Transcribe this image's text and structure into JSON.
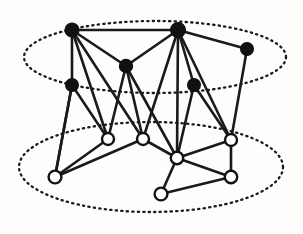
{
  "figure": {
    "background_color": "#fdfdfb",
    "width": 303,
    "height": 234,
    "edge_color": "#1a1a1a",
    "filled_node_color": "#111111",
    "hollow_node_fill": "#ffffff",
    "dotted_ellipse_color": "#1a1a1a"
  },
  "layers": [
    {
      "id": "upper-layer",
      "name": "upper-layer-ellipse",
      "style": "dotted",
      "cx": 155,
      "cy": 57,
      "rx": 131,
      "ry": 36
    },
    {
      "id": "lower-layer",
      "name": "lower-layer-ellipse",
      "style": "dotted",
      "cx": 151,
      "cy": 167,
      "rx": 132,
      "ry": 45
    }
  ],
  "nodes": [
    {
      "id": "b1",
      "name": "filled-node-top-left",
      "type": "filled",
      "x": 72,
      "y": 30,
      "r": 7.0
    },
    {
      "id": "b2",
      "name": "filled-node-top-center",
      "type": "filled",
      "x": 178,
      "y": 30,
      "r": 7.4
    },
    {
      "id": "b3",
      "name": "filled-node-top-right",
      "type": "filled",
      "x": 247,
      "y": 49,
      "r": 6.4
    },
    {
      "id": "b4",
      "name": "filled-node-mid-center",
      "type": "filled",
      "x": 126,
      "y": 66,
      "r": 6.6
    },
    {
      "id": "b5",
      "name": "filled-node-mid-left",
      "type": "filled",
      "x": 72,
      "y": 85,
      "r": 6.4
    },
    {
      "id": "b6",
      "name": "filled-node-mid-right",
      "type": "filled",
      "x": 194,
      "y": 85,
      "r": 6.4
    },
    {
      "id": "w1",
      "name": "hollow-node-left-upper",
      "type": "hollow",
      "x": 108,
      "y": 139,
      "r": 6.0
    },
    {
      "id": "w2",
      "name": "hollow-node-center-upper",
      "type": "hollow",
      "x": 143,
      "y": 139,
      "r": 6.0
    },
    {
      "id": "w3",
      "name": "hollow-node-right-upper",
      "type": "hollow",
      "x": 231,
      "y": 140,
      "r": 6.0
    },
    {
      "id": "w4",
      "name": "hollow-node-center-hub",
      "type": "hollow",
      "x": 177,
      "y": 158,
      "r": 6.2
    },
    {
      "id": "w5",
      "name": "hollow-node-left-lower",
      "type": "hollow",
      "x": 55,
      "y": 177,
      "r": 6.4
    },
    {
      "id": "w6",
      "name": "hollow-node-right-lower",
      "type": "hollow",
      "x": 231,
      "y": 177,
      "r": 6.2
    },
    {
      "id": "w7",
      "name": "hollow-node-bottom",
      "type": "hollow",
      "x": 161,
      "y": 194,
      "r": 6.4
    }
  ],
  "edges": [
    {
      "name": "edge-b1-b2",
      "from": "b1",
      "to": "b2"
    },
    {
      "name": "edge-b1-b4",
      "from": "b1",
      "to": "b4"
    },
    {
      "name": "edge-b1-b5",
      "from": "b1",
      "to": "b5"
    },
    {
      "name": "edge-b1-w1",
      "from": "b1",
      "to": "w1"
    },
    {
      "name": "edge-b1-w2",
      "from": "b1",
      "to": "w2"
    },
    {
      "name": "edge-b2-b3",
      "from": "b2",
      "to": "b3"
    },
    {
      "name": "edge-b2-b4",
      "from": "b2",
      "to": "b4"
    },
    {
      "name": "edge-b2-b6",
      "from": "b2",
      "to": "b6"
    },
    {
      "name": "edge-b2-w2",
      "from": "b2",
      "to": "w2"
    },
    {
      "name": "edge-b2-w3",
      "from": "b2",
      "to": "w3"
    },
    {
      "name": "edge-b2-w4",
      "from": "b2",
      "to": "w4"
    },
    {
      "name": "edge-b3-w3",
      "from": "b3",
      "to": "w3"
    },
    {
      "name": "edge-b4-w1",
      "from": "b4",
      "to": "w1"
    },
    {
      "name": "edge-b4-w2",
      "from": "b4",
      "to": "w2"
    },
    {
      "name": "edge-b4-w4",
      "from": "b4",
      "to": "w4"
    },
    {
      "name": "edge-b5-w1",
      "from": "b5",
      "to": "w1"
    },
    {
      "name": "edge-b5-w5",
      "from": "b5",
      "to": "w5"
    },
    {
      "name": "edge-b5-w5b",
      "from": "b5",
      "to": "w5"
    },
    {
      "name": "edge-b6-w3",
      "from": "b6",
      "to": "w3"
    },
    {
      "name": "edge-b6-w4",
      "from": "b6",
      "to": "w4"
    },
    {
      "name": "edge-w1-w5",
      "from": "w1",
      "to": "w5"
    },
    {
      "name": "edge-w2-w5",
      "from": "w2",
      "to": "w5"
    },
    {
      "name": "edge-w2-w4",
      "from": "w2",
      "to": "w4"
    },
    {
      "name": "edge-w3-w4",
      "from": "w3",
      "to": "w4"
    },
    {
      "name": "edge-w3-w6",
      "from": "w3",
      "to": "w6"
    },
    {
      "name": "edge-w4-w6",
      "from": "w4",
      "to": "w6"
    },
    {
      "name": "edge-w4-w7",
      "from": "w4",
      "to": "w7"
    },
    {
      "name": "edge-w6-w7",
      "from": "w6",
      "to": "w7"
    }
  ],
  "counts": {
    "filled_nodes": 6,
    "hollow_nodes": 7,
    "edges": 28,
    "layers": 2
  }
}
